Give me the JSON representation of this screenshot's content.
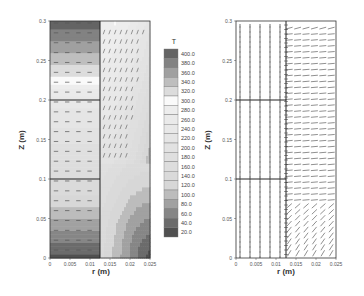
{
  "chart_data": [
    {
      "type": "heatmap",
      "title": "",
      "xlabel": "r (m)",
      "ylabel": "Z (m)",
      "xlim": [
        0,
        0.025
      ],
      "ylim": [
        0,
        0.3
      ],
      "xticks": [
        "0",
        "0.005",
        "0.01",
        "0.015",
        "0.02",
        "0.025"
      ],
      "yticks": [
        "0",
        "0.05",
        "0.1",
        "0.15",
        "0.2",
        "0.25",
        "0.3"
      ],
      "colorbar": {
        "title": "T",
        "levels": [
          "400.0",
          "380.0",
          "360.0",
          "340.0",
          "320.0",
          "300.0",
          "280.0",
          "260.0",
          "240.0",
          "220.0",
          "200.0",
          "180.0",
          "160.0",
          "140.0",
          "120.0",
          "100.0",
          "80.0",
          "60.0",
          "40.0",
          "20.0"
        ]
      },
      "annotations": {
        "vertical_divider_r": 0.0125,
        "horizontal_lines_z": [
          0.2,
          0.1
        ],
        "overlay": "velocity vectors (dashed horizontal in inner region, upward slanted in outer region)"
      },
      "grid": false
    },
    {
      "type": "scatter",
      "title": "",
      "xlabel": "r (m)",
      "ylabel": "Z (m)",
      "xlim": [
        0,
        0.025
      ],
      "ylim": [
        0,
        0.3
      ],
      "xticks": [
        "0",
        "0.005",
        "0.01",
        "0.015",
        "0.02",
        "0.025"
      ],
      "yticks": [
        "0",
        "0.05",
        "0.1",
        "0.15",
        "0.2",
        "0.25",
        "0.3"
      ],
      "annotations": {
        "vertical_divider_r": 0.0125,
        "horizontal_lines_z": [
          0.2,
          0.1
        ],
        "inner_vertical_lines_r": [
          0.001,
          0.0035,
          0.006,
          0.0085,
          0.011
        ],
        "overlay": "vector field (vertical in inner region, near-horizontal in outer region, diagonal near bottom)"
      },
      "grid": false
    }
  ],
  "labels": {
    "left_xlabel": "r (m)",
    "left_ylabel": "Z (m)",
    "right_xlabel": "r (m)",
    "right_ylabel": "Z (m)",
    "colorbar_title": "T"
  }
}
